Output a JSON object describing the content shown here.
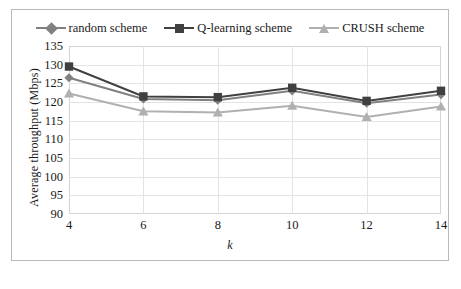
{
  "chart_data": {
    "type": "line",
    "title": "",
    "xlabel": "k",
    "ylabel": "Average throughput (Mbps)",
    "x": [
      4,
      6,
      8,
      10,
      12,
      14
    ],
    "categories": [
      "4",
      "6",
      "8",
      "10",
      "12",
      "14"
    ],
    "xlim": [
      4,
      14
    ],
    "ylim": [
      90,
      135
    ],
    "yticks": [
      135,
      130,
      125,
      120,
      115,
      110,
      105,
      100,
      95,
      90
    ],
    "xticks": [
      4,
      6,
      8,
      10,
      12,
      14
    ],
    "grid": true,
    "legend_position": "top-center",
    "series": [
      {
        "name": "random scheme",
        "marker": "diamond",
        "color": "#808080",
        "values": [
          126.5,
          120.8,
          120.5,
          123.0,
          119.7,
          122.0
        ]
      },
      {
        "name": "Q-learning scheme",
        "marker": "square",
        "color": "#404040",
        "values": [
          129.5,
          121.5,
          121.3,
          123.8,
          120.3,
          123.0
        ]
      },
      {
        "name": "CRUSH scheme",
        "marker": "triangle",
        "color": "#b0b0b0",
        "values": [
          122.3,
          117.5,
          117.2,
          119.0,
          116.0,
          118.8
        ]
      }
    ]
  }
}
